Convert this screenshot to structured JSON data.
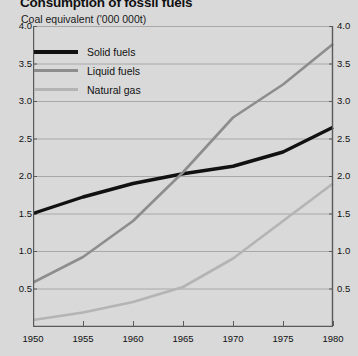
{
  "chart_data": {
    "type": "line",
    "title": "Consumption of fossil fuels",
    "subtitle": "Coal equivalent ('000 000t)",
    "xlabel": "",
    "ylabel": "",
    "xlim": [
      1950,
      1980
    ],
    "ylim": [
      0,
      4.0
    ],
    "grid": true,
    "legend_position": "top-left",
    "x_ticks": [
      "1950",
      "1955",
      "1960",
      "1965",
      "1970",
      "1975",
      "1980"
    ],
    "y_ticks_left": [
      "4.0",
      "3.5",
      "3.0",
      "2.5",
      "2.0",
      "1.5",
      "1.0",
      "0.5"
    ],
    "y_ticks_right": [
      "4.0",
      "3.5",
      "3.0",
      "2.5",
      "2.0",
      "1.5",
      "1.0",
      "0.5"
    ],
    "x": [
      1950,
      1955,
      1960,
      1965,
      1970,
      1975,
      1980
    ],
    "series": [
      {
        "name": "Solid fuels",
        "color": "#111111",
        "width": 3.4,
        "values": [
          1.5,
          1.72,
          1.9,
          2.03,
          2.13,
          2.32,
          2.65
        ]
      },
      {
        "name": "Liquid fuels",
        "color": "#8d8d8d",
        "width": 2.6,
        "values": [
          0.58,
          0.92,
          1.4,
          2.05,
          2.78,
          3.22,
          3.76
        ]
      },
      {
        "name": "Natural gas",
        "color": "#b4b4b4",
        "width": 2.6,
        "values": [
          0.08,
          0.18,
          0.32,
          0.52,
          0.9,
          1.4,
          1.9
        ]
      }
    ]
  },
  "legend": {
    "items": [
      {
        "label": "Solid fuels",
        "color": "#111111",
        "thickness": "4px"
      },
      {
        "label": "Liquid fuels",
        "color": "#8d8d8d",
        "thickness": "3px"
      },
      {
        "label": "Natural gas",
        "color": "#b4b4b4",
        "thickness": "3px"
      }
    ]
  },
  "colors": {
    "background": "#d9d9d9",
    "axis": "#5a5a5a",
    "grid": "#a8a8a8"
  }
}
